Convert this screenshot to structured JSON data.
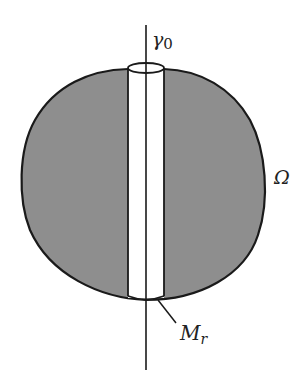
{
  "labels": {
    "axis": "γ0",
    "axis_base": "γ",
    "axis_sub": "0",
    "region": "Ω",
    "tube": "M",
    "tube_sub": "r"
  },
  "colors": {
    "region_fill": "#8e8e8e",
    "outline": "#1a1a1a",
    "tube_fill": "#ffffff",
    "background": "#ffffff"
  }
}
